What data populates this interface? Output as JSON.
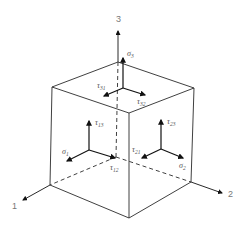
{
  "diagram": {
    "colors": {
      "line": "#2a2a2a",
      "arrow": "#111111",
      "label": "#555555",
      "axis_label": "#777777"
    },
    "axes": [
      {
        "id": "1",
        "label": "1"
      },
      {
        "id": "2",
        "label": "2"
      },
      {
        "id": "3",
        "label": "3"
      }
    ],
    "faces": {
      "top": {
        "normal": {
          "sym": "σ",
          "sub": "3"
        },
        "shear": [
          {
            "sym": "τ",
            "sub": "31"
          },
          {
            "sym": "τ",
            "sub": "32"
          }
        ]
      },
      "left": {
        "normal": {
          "sym": "σ",
          "sub": "1"
        },
        "shear": [
          {
            "sym": "τ",
            "sub": "13"
          },
          {
            "sym": "τ",
            "sub": "12"
          }
        ]
      },
      "right": {
        "normal": {
          "sym": "σ",
          "sub": "2"
        },
        "shear": [
          {
            "sym": "τ",
            "sub": "23"
          },
          {
            "sym": "τ",
            "sub": "21"
          }
        ]
      }
    }
  }
}
